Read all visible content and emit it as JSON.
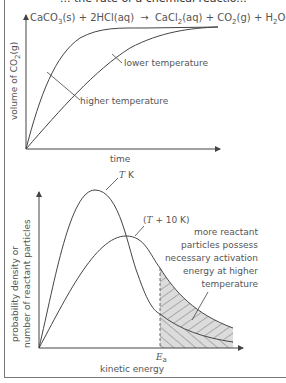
{
  "header": {
    "title_cut": "... the rate of a chemical reactio..."
  },
  "graph1": {
    "equation": {
      "reactant1": "CaCO",
      "reactant1_sub": "3",
      "reactant1_state": "(s) + 2HCl(aq)",
      "arrow": "→",
      "product1": "CaCl",
      "product1_sub": "2",
      "product1_state": "(aq) + CO",
      "product2_sub": "2",
      "product2_state": "(g) + H",
      "product3_sub": "2",
      "product3_state": "O(l)"
    },
    "ylabel_main": "volume of CO",
    "ylabel_sub": "2",
    "ylabel_tail": "(g)",
    "xlabel": "time",
    "curve_labels": {
      "lower": "lower temperature",
      "higher": "higher temperature"
    }
  },
  "graph2": {
    "ylabel_line1": "probability density or",
    "ylabel_line2": "number of reactant particles",
    "xlabel": "kinetic energy",
    "ea_label": "E",
    "ea_sub": "a",
    "curve_T": "T",
    "curve_T_unit": " K",
    "curve_T10_open": "(",
    "curve_T10": "T",
    "curve_T10_rest": " + 10 K)",
    "annotation": [
      "more reactant",
      "particles possess",
      "necessary activation",
      "energy at higher",
      "temperature"
    ]
  },
  "colors": {
    "line": "#444444",
    "text": "#555555",
    "shade": "#d9d9d9",
    "hatch": "#777777"
  }
}
